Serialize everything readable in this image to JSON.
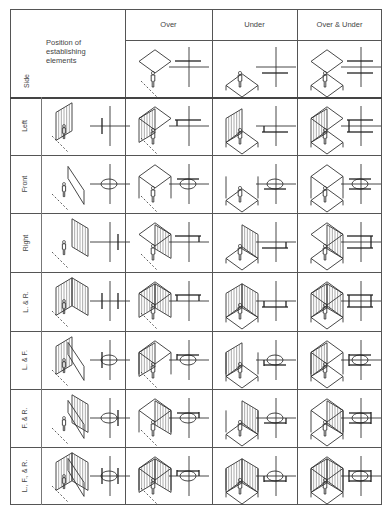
{
  "table": {
    "corner": {
      "title_lines": [
        "Position of",
        "establishing",
        "elements"
      ],
      "axis_label": "Side"
    },
    "columns": [
      {
        "key": "over",
        "label": "Over"
      },
      {
        "key": "under",
        "label": "Under"
      },
      {
        "key": "over_under",
        "label": "Over & Under"
      }
    ],
    "rows": [
      {
        "key": "left",
        "label": "Left",
        "walls": [
          "L"
        ]
      },
      {
        "key": "front",
        "label": "Front",
        "walls": [
          "F"
        ]
      },
      {
        "key": "right",
        "label": "Right",
        "walls": [
          "R"
        ]
      },
      {
        "key": "l_r",
        "label": "L. & R.",
        "walls": [
          "L",
          "R"
        ]
      },
      {
        "key": "l_f",
        "label": "L. & F.",
        "walls": [
          "L",
          "F"
        ]
      },
      {
        "key": "f_r",
        "label": "F. & R.",
        "walls": [
          "F",
          "R"
        ]
      },
      {
        "key": "l_f_r",
        "label": "L., F., & R.",
        "walls": [
          "L",
          "F",
          "R"
        ]
      }
    ]
  },
  "layout": {
    "left": 10,
    "top": 9,
    "right": 382,
    "bottom": 505,
    "label_col_right": 30,
    "side_col_right": 125,
    "col_lines": [
      125,
      212,
      297,
      382
    ],
    "header_line": 40,
    "row_lines": [
      97,
      155,
      213,
      272,
      331,
      389,
      447,
      505
    ]
  },
  "colors": {
    "line": "#333333",
    "grid": "#555555",
    "text": "#444444",
    "background": "#ffffff"
  }
}
